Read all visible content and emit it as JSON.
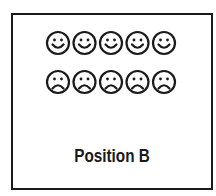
{
  "diagram": {
    "rows": [
      {
        "type": "happy",
        "count": 5
      },
      {
        "type": "sad",
        "count": 5
      }
    ],
    "caption": "Position B",
    "colors": {
      "stroke": "#1a1a1a",
      "background": "#ffffff"
    }
  }
}
